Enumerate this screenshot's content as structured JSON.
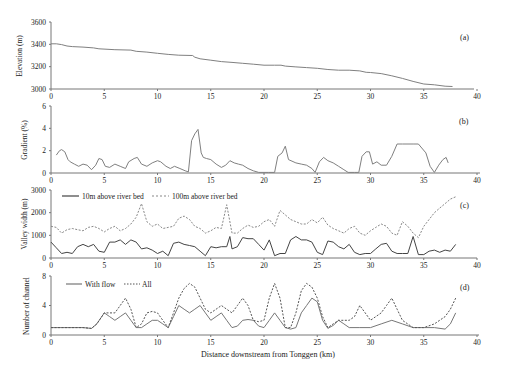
{
  "chart_data": [
    {
      "panel": "(a)",
      "type": "line",
      "ylabel": "Elevation (m)",
      "xlabel": "",
      "ylim": [
        3000,
        3600
      ],
      "yticks": [
        3000,
        3200,
        3400,
        3600
      ],
      "xlim": [
        0,
        40
      ],
      "xticks": [
        0,
        5,
        10,
        15,
        20,
        25,
        30,
        35,
        40
      ],
      "series": [
        {
          "name": "Elevation",
          "color": "#808080",
          "style": "solid",
          "x": [
            0,
            0.5,
            1,
            1.5,
            2,
            3,
            4,
            4.5,
            6,
            7.5,
            8,
            9,
            10,
            11,
            12,
            13.3,
            13.5,
            14,
            15,
            16,
            17,
            18,
            19,
            20,
            21,
            21.6,
            22,
            23,
            24,
            25,
            26,
            27,
            28,
            29,
            29.6,
            30,
            31,
            32,
            33,
            34,
            35,
            36,
            37,
            37.7
          ],
          "y": [
            3405,
            3405,
            3398,
            3385,
            3380,
            3375,
            3368,
            3360,
            3352,
            3348,
            3338,
            3330,
            3320,
            3310,
            3303,
            3300,
            3285,
            3270,
            3258,
            3245,
            3238,
            3230,
            3222,
            3213,
            3213,
            3213,
            3205,
            3198,
            3192,
            3185,
            3175,
            3168,
            3168,
            3162,
            3150,
            3148,
            3138,
            3118,
            3095,
            3068,
            3045,
            3038,
            3025,
            3022
          ]
        }
      ]
    },
    {
      "panel": "(b)",
      "type": "line",
      "ylabel": "Gradient (%)",
      "ylim": [
        0,
        6
      ],
      "yticks": [
        0,
        2,
        4,
        6
      ],
      "xlim": [
        0,
        40
      ],
      "xticks": [
        0,
        5,
        10,
        15,
        20,
        25,
        30,
        35,
        40
      ],
      "series": [
        {
          "name": "Gradient",
          "color": "#808080",
          "style": "solid",
          "x": [
            0.5,
            0.8,
            1,
            1.3,
            1.6,
            1.8,
            2.2,
            2.6,
            3,
            3.4,
            3.8,
            4.2,
            4.5,
            4.8,
            5.1,
            5.5,
            6,
            6.5,
            7,
            7.3,
            7.8,
            8.1,
            8.5,
            9,
            9.5,
            10,
            10.3,
            10.8,
            11.2,
            11.6,
            12.1,
            12.6,
            12.9,
            13.2,
            13.5,
            13.8,
            14.1,
            14.3,
            14.6,
            15,
            15.5,
            16,
            16.4,
            16.8,
            17.2,
            17.6,
            18,
            18.5,
            19,
            19.5,
            20,
            20.4,
            21,
            21.3,
            21.7,
            22,
            22.3,
            23,
            23.5,
            24,
            24.5,
            24.8,
            25.2,
            25.6,
            26,
            26.5,
            27,
            27.5,
            27.9,
            28.5,
            28.9,
            29.2,
            29.6,
            29.9,
            30.2,
            30.6,
            31,
            31.5,
            32,
            32.5,
            33,
            34,
            34.5,
            35.2,
            35.6,
            36,
            36.4,
            36.8,
            37.1,
            37.3
          ],
          "y": [
            1.6,
            2.0,
            2.1,
            1.9,
            1.2,
            1.0,
            0.8,
            0.6,
            0.8,
            0.7,
            0.3,
            0.7,
            1.3,
            1.2,
            0.6,
            0.5,
            0.8,
            0.6,
            0.4,
            1.0,
            1.3,
            1.4,
            0.8,
            0.6,
            0.9,
            1.1,
            1.0,
            0.6,
            0.4,
            0.6,
            0.4,
            0.2,
            0.1,
            2.9,
            3.5,
            3.9,
            1.8,
            1.4,
            1.3,
            1.2,
            0.8,
            0.5,
            0.7,
            1.1,
            0.9,
            0.8,
            0.7,
            0.4,
            0.2,
            0.05,
            0.05,
            0.05,
            0.05,
            1.5,
            1.8,
            2.4,
            1.2,
            0.9,
            0.8,
            0.7,
            0.4,
            0.05,
            1.0,
            1.4,
            1.1,
            0.9,
            0.6,
            0.3,
            0.05,
            0.05,
            0.05,
            1.5,
            1.9,
            1.9,
            0.8,
            1.0,
            0.7,
            0.7,
            1.5,
            2.6,
            2.6,
            2.6,
            2.6,
            1.8,
            0.6,
            0.05,
            0.7,
            1.2,
            1.4,
            0.9
          ]
        }
      ]
    },
    {
      "panel": "(c)",
      "type": "line",
      "ylabel": "Valley width (m)",
      "ylim": [
        0,
        3000
      ],
      "yticks": [
        0,
        1000,
        2000,
        3000
      ],
      "xlim": [
        0,
        40
      ],
      "xticks": [
        0,
        5,
        10,
        15,
        20,
        25,
        30,
        35,
        40
      ],
      "legend": [
        "10m above river bed",
        "100m above river bed"
      ],
      "series": [
        {
          "name": "10m above river bed",
          "color": "#444444",
          "style": "solid",
          "x": [
            0,
            0.5,
            1,
            1.5,
            2,
            2.5,
            3,
            3.5,
            4,
            4.5,
            5,
            5.5,
            6,
            6.5,
            7,
            7.5,
            8,
            8.5,
            9,
            9.5,
            10,
            10.5,
            11,
            11.5,
            12,
            12.5,
            13,
            13.5,
            14,
            14.5,
            15,
            15.5,
            16,
            16.5,
            16.8,
            17,
            17.5,
            18,
            18.5,
            19,
            19.5,
            20,
            20.5,
            21,
            21.5,
            22,
            22.5,
            23,
            23.5,
            24,
            24.5,
            25,
            25.5,
            26,
            26.5,
            27,
            27.5,
            28,
            28.5,
            29,
            29.5,
            30,
            30.5,
            31,
            31.5,
            32,
            32.5,
            33,
            33.5,
            34,
            34.5,
            35,
            35.5,
            36,
            36.5,
            37,
            37.5,
            38
          ],
          "y": [
            700,
            450,
            200,
            250,
            200,
            500,
            600,
            500,
            600,
            300,
            250,
            700,
            700,
            800,
            600,
            800,
            700,
            400,
            450,
            350,
            200,
            300,
            100,
            650,
            700,
            600,
            550,
            500,
            300,
            100,
            500,
            450,
            500,
            500,
            950,
            400,
            500,
            900,
            850,
            850,
            600,
            350,
            800,
            100,
            200,
            200,
            800,
            950,
            800,
            800,
            700,
            250,
            150,
            750,
            700,
            500,
            400,
            600,
            250,
            150,
            200,
            200,
            400,
            600,
            650,
            300,
            200,
            200,
            200,
            950,
            150,
            150,
            300,
            350,
            250,
            350,
            300,
            600
          ]
        },
        {
          "name": "100m above river bed",
          "color": "#888888",
          "style": "dashed",
          "x": [
            0,
            0.5,
            1,
            1.5,
            2,
            2.5,
            3,
            3.5,
            4,
            4.5,
            5,
            5.5,
            6,
            6.5,
            7,
            7.5,
            8,
            8.5,
            9,
            9.5,
            10,
            10.5,
            11,
            11.5,
            12,
            12.5,
            13,
            13.5,
            14,
            14.5,
            15,
            15.5,
            16,
            16.5,
            17,
            17.5,
            18,
            18.5,
            19,
            19.5,
            20,
            20.5,
            21,
            21.5,
            22,
            22.5,
            23,
            23.5,
            24,
            24.5,
            25,
            25.5,
            26,
            26.5,
            27,
            27.5,
            28,
            28.5,
            29,
            29.5,
            30,
            30.5,
            31,
            31.5,
            32,
            32.5,
            33,
            33.5,
            34,
            34.5,
            35,
            35.5,
            36,
            36.5,
            37,
            37.5,
            38
          ],
          "y": [
            1400,
            1350,
            1100,
            1250,
            1300,
            1250,
            1200,
            1350,
            1400,
            1300,
            1150,
            1300,
            1400,
            1200,
            1300,
            1500,
            1800,
            2400,
            1600,
            1400,
            1500,
            1300,
            1350,
            1400,
            1750,
            1850,
            1700,
            1400,
            1300,
            1100,
            1200,
            1350,
            1300,
            2350,
            1100,
            1100,
            1300,
            1450,
            1350,
            1400,
            1600,
            1700,
            1400,
            2100,
            1900,
            1700,
            1600,
            1500,
            1500,
            1700,
            1550,
            1800,
            1450,
            1300,
            1200,
            1100,
            1300,
            1400,
            1100,
            1000,
            1200,
            1350,
            1500,
            1400,
            1100,
            1000,
            1600,
            1400,
            1100,
            900,
            1400,
            1700,
            2000,
            2200,
            2400,
            2600,
            2700
          ]
        }
      ]
    },
    {
      "panel": "(d)",
      "type": "line",
      "ylabel": "Number of channel",
      "xlabel": "Distance downstream from Tonggen (km)",
      "ylim": [
        0,
        8
      ],
      "yticks": [
        0,
        4,
        8
      ],
      "xlim": [
        0,
        40
      ],
      "xticks": [
        0,
        5,
        10,
        15,
        20,
        25,
        30,
        35,
        40
      ],
      "legend": [
        "With flow",
        "All"
      ],
      "series": [
        {
          "name": "With flow",
          "color": "#777777",
          "style": "solid",
          "x": [
            0,
            3,
            3.8,
            4.3,
            5,
            5.5,
            6,
            6.5,
            7,
            7.5,
            8,
            8.5,
            9,
            9.5,
            10,
            10.5,
            11,
            11.5,
            12,
            12.5,
            13,
            13.5,
            14,
            14.5,
            15,
            15.5,
            16,
            16.5,
            17,
            17.5,
            18,
            18.5,
            19,
            19.5,
            20,
            20.5,
            21,
            21.5,
            22,
            22.5,
            23,
            23.5,
            24,
            24.5,
            25,
            25.5,
            26,
            26.5,
            27,
            27.5,
            28,
            29,
            30,
            31,
            32,
            33,
            34,
            35,
            36,
            37,
            37.5,
            38
          ],
          "y": [
            1,
            1,
            0.9,
            1.5,
            3,
            2.5,
            2,
            2.5,
            3,
            2,
            1,
            1,
            1.5,
            2,
            2,
            1.5,
            1,
            2.5,
            4,
            3.5,
            3,
            3.5,
            4,
            3,
            2,
            2.5,
            3,
            2,
            1,
            1.2,
            2,
            2.1,
            2,
            1.2,
            1,
            2,
            3,
            2,
            1,
            0.8,
            1,
            3,
            4,
            5,
            4.5,
            2,
            0.9,
            1.3,
            2,
            1.5,
            1,
            1,
            1,
            1.5,
            2,
            1.5,
            1,
            1,
            1,
            0.8,
            1.5,
            3
          ]
        },
        {
          "name": "All",
          "color": "#555555",
          "style": "dashed",
          "x": [
            0,
            3,
            3.8,
            4.3,
            5,
            5.5,
            6,
            6.5,
            7,
            7.5,
            8,
            8.5,
            9,
            9.5,
            10,
            10.5,
            11,
            11.5,
            12,
            12.5,
            13,
            13.5,
            14,
            14.5,
            15,
            15.5,
            16,
            16.5,
            17,
            17.5,
            18,
            18.5,
            19,
            19.5,
            20,
            20.5,
            21,
            21.5,
            22,
            22.5,
            23,
            23.5,
            24,
            24.5,
            25,
            25.5,
            26,
            26.5,
            27,
            27.5,
            28,
            28.5,
            29,
            29.5,
            30,
            30.5,
            31,
            31.5,
            32,
            32.5,
            33,
            34,
            35,
            36,
            37,
            37.5,
            38
          ],
          "y": [
            1,
            1,
            0.9,
            1.5,
            3,
            3,
            3,
            4,
            5,
            3.5,
            1,
            1.5,
            3,
            3.2,
            3,
            2,
            1,
            3,
            5,
            6.3,
            7,
            6.5,
            5,
            3.5,
            3,
            3.5,
            4,
            3.5,
            3,
            4,
            5,
            4,
            2,
            1.8,
            2,
            5,
            7,
            5,
            1,
            1,
            3,
            6,
            7,
            6.5,
            5,
            2.5,
            1,
            1.5,
            2,
            2,
            2,
            2.5,
            4,
            3,
            2,
            2.5,
            3,
            4,
            5,
            3.5,
            2,
            1,
            1,
            1.5,
            2.5,
            3.5,
            5
          ]
        }
      ]
    }
  ],
  "panels": {
    "a": {
      "label": "(a)",
      "ylabel": "Elevation (m)",
      "yticks": [
        "3000",
        "3200",
        "3400",
        "3600"
      ]
    },
    "b": {
      "label": "(b)",
      "ylabel": "Gradient (%)",
      "yticks": [
        "0",
        "2",
        "4",
        "6"
      ]
    },
    "c": {
      "label": "(c)",
      "ylabel": "Valley width (m)",
      "yticks": [
        "0",
        "1000",
        "2000",
        "3000"
      ],
      "legend1": "10m above river bed",
      "legend2": "100m above river bed"
    },
    "d": {
      "label": "(d)",
      "ylabel": "Number of channel",
      "yticks": [
        "0",
        "4",
        "8"
      ],
      "legend1": "With flow",
      "legend2": "All"
    }
  },
  "xticks": [
    "0",
    "5",
    "10",
    "15",
    "20",
    "25",
    "30",
    "35",
    "40"
  ],
  "xlabel": "Distance downstream from Tonggen (km)"
}
